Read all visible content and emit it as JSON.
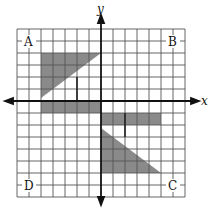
{
  "diagram": {
    "type": "coordinate-grid-transformations",
    "axes": {
      "x_label": "x",
      "y_label": "y"
    },
    "grid": {
      "columns": 14,
      "rows": 14,
      "line_color": "#555555",
      "axis_color": "#111111"
    },
    "corner_labels": {
      "top_left": "A",
      "top_right": "B",
      "bottom_right": "C",
      "bottom_left": "D"
    },
    "shapes": [
      {
        "name": "triangle-upper-left",
        "fill": "#8a8a8a"
      },
      {
        "name": "strip-left-below-x-axis",
        "fill": "#8a8a8a"
      },
      {
        "name": "strip-right-below-x-axis",
        "fill": "#8a8a8a"
      },
      {
        "name": "triangle-lower-right",
        "fill": "#8a8a8a"
      }
    ]
  }
}
